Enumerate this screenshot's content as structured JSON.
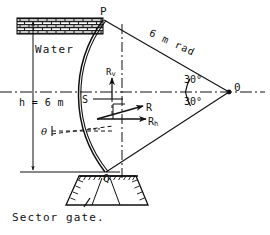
{
  "figure": {
    "caption": "Sector gate.",
    "labels": {
      "point_p": "P",
      "point_o": "0",
      "point_q": "Q",
      "point_s": "S",
      "water": "Water",
      "depth": "h = 6 m",
      "radius": "6 m rad",
      "force_vertical": "R",
      "force_vertical_sub": "v",
      "force_resultant": "R",
      "force_horizontal": "R",
      "force_horizontal_sub": "h",
      "angle_upper": "30°",
      "angle_lower": "30°",
      "angle_theta": "θ"
    },
    "geometry": {
      "point_p": [
        103,
        20
      ],
      "point_o": [
        229,
        92
      ],
      "point_q": [
        105,
        172
      ],
      "point_s": [
        95,
        99
      ],
      "radius_m": 6,
      "half_angle_deg": 30,
      "depth_m": 6
    },
    "colors": {
      "line": "#111111",
      "hatch": "#333333",
      "background": "#ffffff"
    }
  }
}
